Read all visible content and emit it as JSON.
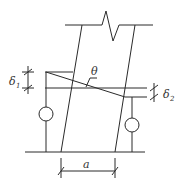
{
  "diagram": {
    "title": "",
    "labels": {
      "theta": "θ",
      "delta1": "δ",
      "delta1_sub": "1",
      "delta2": "δ",
      "delta2_sub": "2",
      "a": "a"
    },
    "colors": {
      "line": "#2a2a2a",
      "text": "#333333",
      "background": "#ffffff"
    }
  }
}
